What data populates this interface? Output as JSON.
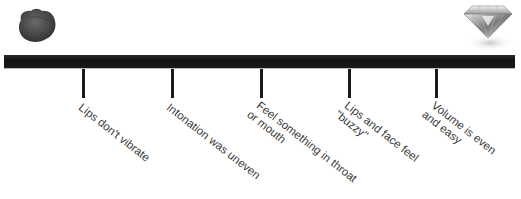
{
  "scale": {
    "left_icon": "rock-icon",
    "right_icon": "diamond-icon",
    "bar_color": "#151515",
    "tick_color": "#1a1a1a",
    "text_color": "#3a3a3a"
  },
  "markers": [
    {
      "line1": "Lips don't vibrate",
      "line2": ""
    },
    {
      "line1": "Intonation was uneven",
      "line2": ""
    },
    {
      "line1": "Feel something in throat",
      "line2": "or mouth"
    },
    {
      "line1": "Lips and face feel",
      "line2": "\"buzzy\""
    },
    {
      "line1": "Volume is even",
      "line2": "and easy"
    }
  ]
}
